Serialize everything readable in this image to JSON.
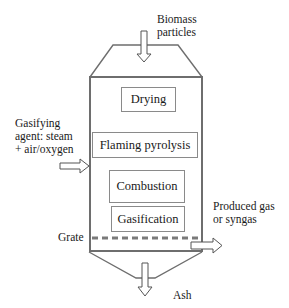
{
  "diagram": {
    "type": "updraft-gasifier-schematic",
    "inputs": {
      "biomass": {
        "line1": "Biomass",
        "line2": "particles"
      },
      "gasifying_agent": {
        "line1": "Gasifying",
        "line2": "agent: steam",
        "line3": "+ air/oxygen"
      }
    },
    "zones": [
      {
        "label": "Drying"
      },
      {
        "label": "Flaming pyrolysis"
      },
      {
        "label": "Combustion"
      },
      {
        "label": "Gasification"
      }
    ],
    "grate": {
      "label": "Grate"
    },
    "outputs": {
      "gas": {
        "line1": "Produced gas",
        "line2": "or syngas"
      },
      "ash": {
        "label": "Ash"
      }
    },
    "colors": {
      "vessel_stroke": "#6e6e6e",
      "box_stroke": "#8a8a8a",
      "grate_dash": "#7a7a7a",
      "arrow_stroke": "#555555",
      "text": "#1a1a1a"
    }
  }
}
